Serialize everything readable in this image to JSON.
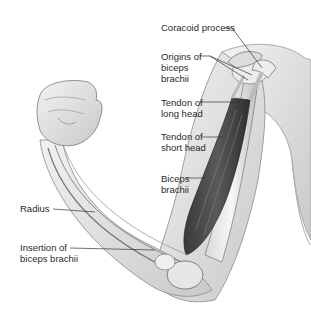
{
  "diagram": {
    "labels": [
      {
        "id": "coracoid-process",
        "text": "Coracoid process",
        "x": 161,
        "y": 22
      },
      {
        "id": "origins-of-biceps-brachii",
        "text": "Origins of\nbiceps\nbrachii",
        "x": 161,
        "y": 51
      },
      {
        "id": "tendon-of-long-head",
        "text": "Tendon of\nlong head",
        "x": 161,
        "y": 97
      },
      {
        "id": "tendon-of-short-head",
        "text": "Tendon of\nshort head",
        "x": 161,
        "y": 131
      },
      {
        "id": "biceps-brachii",
        "text": "Biceps\nbrachii",
        "x": 161,
        "y": 173
      },
      {
        "id": "radius",
        "text": "Radius",
        "x": 20,
        "y": 203
      },
      {
        "id": "insertion-of-biceps-brachii",
        "text": "Insertion of\nbiceps brachii",
        "x": 20,
        "y": 242
      }
    ]
  }
}
